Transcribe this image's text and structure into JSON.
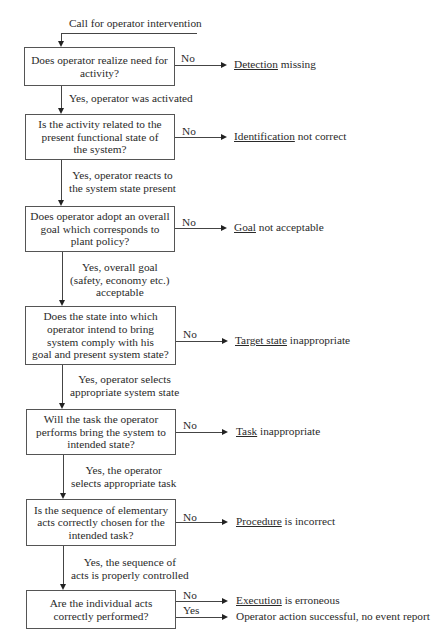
{
  "start": {
    "label": "Call for operator intervention"
  },
  "nodes": [
    {
      "id": "detection",
      "question": "Does operator realize need for activity?",
      "lines": [
        "Does operator realize need for",
        "activity?"
      ],
      "no_label": "No",
      "outcome_key": "Detection",
      "outcome_rest": " missing",
      "yes_lines": [
        "Yes, operator was activated"
      ]
    },
    {
      "id": "identification",
      "question": "Is the activity related to the present functional state of the system?",
      "lines": [
        "Is the activity related to the",
        "present functional state of",
        "the system?"
      ],
      "no_label": "No",
      "outcome_key": "Identification",
      "outcome_rest": " not correct",
      "yes_lines": [
        "Yes, operator reacts to",
        "the system state present"
      ]
    },
    {
      "id": "goal",
      "question": "Does operator adopt an overall goal which corresponds to plant policy?",
      "lines": [
        "Does operator adopt an overall",
        "goal which corresponds to",
        "plant policy?"
      ],
      "no_label": "No",
      "outcome_key": "Goal",
      "outcome_rest": " not acceptable",
      "yes_lines": [
        "Yes, overall goal",
        "(safety, economy etc.)",
        "acceptable"
      ]
    },
    {
      "id": "target-state",
      "question": "Does the state into which operator intend to bring system comply with his goal and present system state?",
      "lines": [
        "Does the state into which",
        "operator intend to bring",
        "system comply with his",
        "goal and present system state?"
      ],
      "no_label": "No",
      "outcome_key": "Target state",
      "outcome_rest": " inappropriate",
      "yes_lines": [
        "Yes, operator selects",
        "appropriate system state"
      ]
    },
    {
      "id": "task",
      "question": "Will the task the operator performs bring the system to intended state?",
      "lines": [
        "Will the task the operator",
        "performs bring the system to",
        "intended state?"
      ],
      "no_label": "No",
      "outcome_key": "Task",
      "outcome_rest": " inappropriate",
      "yes_lines": [
        "Yes, the operator",
        "selects appropriate task"
      ]
    },
    {
      "id": "procedure",
      "question": "Is the sequence of elementary acts correctly chosen for the intended task?",
      "lines": [
        "Is the sequence of elementary",
        "acts correctly chosen for the",
        "intended task?"
      ],
      "no_label": "No",
      "outcome_key": "Procedure",
      "outcome_rest": " is incorrect",
      "yes_lines": [
        "Yes, the sequence of",
        "acts is properly controlled"
      ]
    },
    {
      "id": "execution",
      "question": "Are the individual acts correctly performed?",
      "lines": [
        "Are the individual acts",
        "correctly performed?"
      ],
      "no_label": "No",
      "outcome_key": "Execution",
      "outcome_rest": " is erroneous",
      "yes_label": "Yes",
      "yes_outcome": "Operator action successful, no event report"
    }
  ],
  "colors": {
    "line": "#444444",
    "text": "#2a2a2a",
    "background": "#ffffff"
  }
}
